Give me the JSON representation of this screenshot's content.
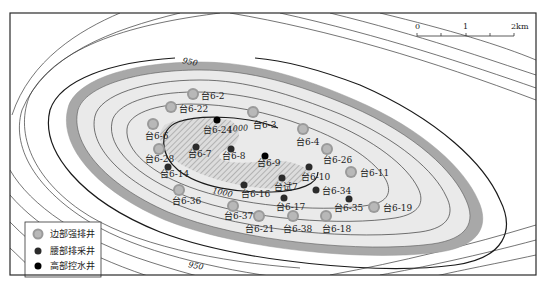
{
  "map": {
    "scale_bar": {
      "labels": [
        "0",
        "1",
        "2km"
      ]
    },
    "contour_labels": [
      {
        "text": "950",
        "x": 182,
        "y": 63,
        "rotate": 12
      },
      {
        "text": "950",
        "x": 188,
        "y": 267,
        "rotate": 10
      },
      {
        "text": "1000",
        "x": 228,
        "y": 132,
        "rotate": -5
      },
      {
        "text": "1000",
        "x": 212,
        "y": 193,
        "rotate": 12
      }
    ],
    "legend": {
      "items": [
        {
          "type": "edge",
          "label": "边部强排井"
        },
        {
          "type": "waist",
          "label": "腰部排采井"
        },
        {
          "type": "high",
          "label": "高部控水井"
        }
      ]
    },
    "colors": {
      "edge_well_outer": "#9a9a9a",
      "edge_well_inner": "#b8b8b8",
      "waist_well": "#2b2b2b",
      "high_well": "#000000",
      "inner_zone": "#e6e6e6",
      "hatch_zone": "#cfcfcf",
      "shade_band": "#a8a8a8"
    },
    "wells": [
      {
        "name": "台6-2",
        "type": "edge",
        "x": 193,
        "y": 94,
        "lx": 201,
        "ly": 99
      },
      {
        "name": "台6-22",
        "type": "edge",
        "x": 171,
        "y": 107,
        "lx": 179,
        "ly": 112
      },
      {
        "name": "台6-3",
        "type": "edge",
        "x": 253,
        "y": 112,
        "lx": 253,
        "ly": 128
      },
      {
        "name": "台6-6",
        "type": "edge",
        "x": 153,
        "y": 124,
        "lx": 145,
        "ly": 139
      },
      {
        "name": "台6-24",
        "type": "high",
        "x": 217,
        "y": 120,
        "lx": 203,
        "ly": 133
      },
      {
        "name": "台6-4",
        "type": "edge",
        "x": 303,
        "y": 129,
        "lx": 296,
        "ly": 145
      },
      {
        "name": "台6-7",
        "type": "waist",
        "x": 196,
        "y": 147,
        "lx": 188,
        "ly": 157
      },
      {
        "name": "台6-8",
        "type": "waist",
        "x": 231,
        "y": 149,
        "lx": 222,
        "ly": 159
      },
      {
        "name": "台6-9",
        "type": "high",
        "x": 265,
        "y": 156,
        "lx": 257,
        "ly": 166
      },
      {
        "name": "台6-28",
        "type": "edge",
        "x": 159,
        "y": 149,
        "lx": 145,
        "ly": 162
      },
      {
        "name": "台6-26",
        "type": "edge",
        "x": 327,
        "y": 149,
        "lx": 323,
        "ly": 163
      },
      {
        "name": "台6-14",
        "type": "waist",
        "x": 168,
        "y": 167,
        "lx": 160,
        "ly": 177
      },
      {
        "name": "台6-10",
        "type": "waist",
        "x": 309,
        "y": 167,
        "lx": 301,
        "ly": 180
      },
      {
        "name": "台6-11",
        "type": "edge",
        "x": 351,
        "y": 172,
        "lx": 360,
        "ly": 176
      },
      {
        "name": "台试7",
        "type": "waist",
        "x": 282,
        "y": 178,
        "lx": 274,
        "ly": 190
      },
      {
        "name": "台6-34",
        "type": "waist",
        "x": 316,
        "y": 190,
        "lx": 322,
        "ly": 194
      },
      {
        "name": "台6-16",
        "type": "waist",
        "x": 244,
        "y": 185,
        "lx": 241,
        "ly": 197
      },
      {
        "name": "台6-36",
        "type": "edge",
        "x": 179,
        "y": 190,
        "lx": 172,
        "ly": 204
      },
      {
        "name": "台6-17",
        "type": "waist",
        "x": 284,
        "y": 198,
        "lx": 276,
        "ly": 210
      },
      {
        "name": "台6-35",
        "type": "waist",
        "x": 349,
        "y": 199,
        "lx": 334,
        "ly": 211
      },
      {
        "name": "台6-19",
        "type": "edge",
        "x": 374,
        "y": 207,
        "lx": 383,
        "ly": 211
      },
      {
        "name": "台6-37",
        "type": "edge",
        "x": 233,
        "y": 206,
        "lx": 224,
        "ly": 219
      },
      {
        "name": "台6-21",
        "type": "edge",
        "x": 259,
        "y": 216,
        "lx": 245,
        "ly": 232
      },
      {
        "name": "台6-38",
        "type": "edge",
        "x": 293,
        "y": 216,
        "lx": 283,
        "ly": 232
      },
      {
        "name": "台6-18",
        "type": "edge",
        "x": 326,
        "y": 216,
        "lx": 322,
        "ly": 232
      }
    ]
  }
}
